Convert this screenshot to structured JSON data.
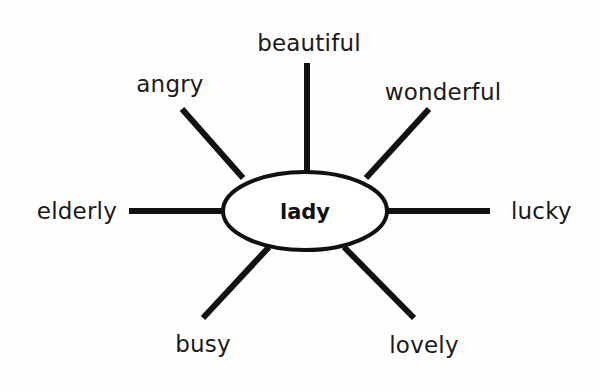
{
  "diagram": {
    "type": "word-web",
    "title": "lady",
    "center": {
      "label": "lady",
      "cx": 305,
      "cy": 211,
      "rx": 82,
      "ry": 39
    },
    "style": {
      "background_color": "#fefefe",
      "stroke_color": "#111111",
      "text_color": "#1a1a1a",
      "ellipse_stroke_width": 4,
      "spoke_stroke_width": 6
    },
    "spokes": [
      {
        "label": "beautiful",
        "direction": "up",
        "line": {
          "x1": 307,
          "y1": 63,
          "x2": 307,
          "y2": 174
        },
        "label_pos": {
          "x": 309,
          "y": 43,
          "anchor": "mid"
        }
      },
      {
        "label": "angry",
        "direction": "up-left",
        "line": {
          "x1": 182,
          "y1": 109,
          "x2": 243,
          "y2": 178
        },
        "label_pos": {
          "x": 170,
          "y": 84,
          "anchor": "mid"
        }
      },
      {
        "label": "wonderful",
        "direction": "up-right",
        "line": {
          "x1": 429,
          "y1": 109,
          "x2": 366,
          "y2": 178
        },
        "label_pos": {
          "x": 443,
          "y": 92,
          "anchor": "mid"
        }
      },
      {
        "label": "elderly",
        "direction": "left",
        "line": {
          "x1": 129,
          "y1": 211,
          "x2": 224,
          "y2": 211
        },
        "label_pos": {
          "x": 117,
          "y": 211,
          "anchor": "right"
        }
      },
      {
        "label": "lucky",
        "direction": "right",
        "line": {
          "x1": 387,
          "y1": 211,
          "x2": 490,
          "y2": 211
        },
        "label_pos": {
          "x": 511,
          "y": 211,
          "anchor": "left"
        }
      },
      {
        "label": "busy",
        "direction": "down-left",
        "line": {
          "x1": 203,
          "y1": 318,
          "x2": 269,
          "y2": 247
        },
        "label_pos": {
          "x": 203,
          "y": 344,
          "anchor": "mid"
        }
      },
      {
        "label": "lovely",
        "direction": "down-right",
        "line": {
          "x1": 414,
          "y1": 318,
          "x2": 344,
          "y2": 247
        },
        "label_pos": {
          "x": 424,
          "y": 345,
          "anchor": "mid"
        }
      }
    ]
  }
}
